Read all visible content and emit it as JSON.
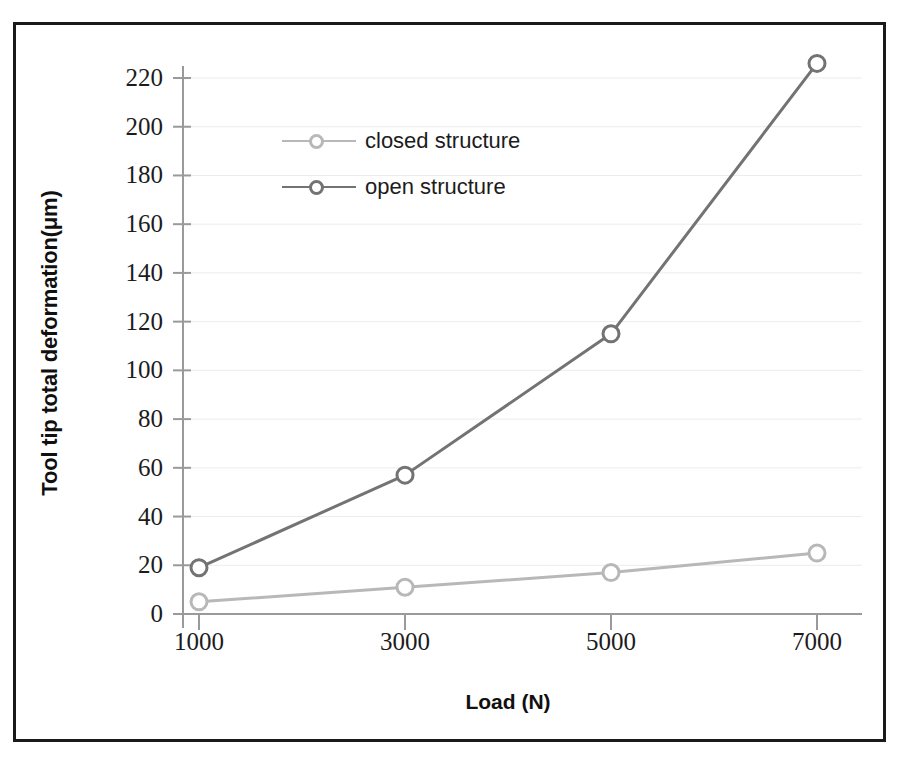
{
  "chart_data": {
    "type": "line",
    "title": "",
    "subtitle": "",
    "xlabel": "Load (N)",
    "ylabel": "Tool tip total deformation(μm)",
    "categories": [
      "1000",
      "3000",
      "5000",
      "7000"
    ],
    "x": [
      1000,
      3000,
      5000,
      7000
    ],
    "series": [
      {
        "name": "closed structure",
        "values": [
          5,
          11,
          17,
          25
        ],
        "color": "#b8b8b8",
        "marker": "open-circle"
      },
      {
        "name": "open structure",
        "values": [
          19,
          57,
          115,
          226
        ],
        "color": "#737373",
        "marker": "open-circle"
      }
    ],
    "ylim": [
      0,
      230
    ],
    "yticks": [
      0,
      20,
      40,
      60,
      80,
      100,
      120,
      140,
      160,
      180,
      200,
      220
    ],
    "ytick_labels": [
      "0",
      "20",
      "40",
      "60",
      "80",
      "100",
      "120",
      "140",
      "160",
      "180",
      "200",
      "220"
    ],
    "xtick_labels": [
      "1000",
      "3000",
      "5000",
      "7000"
    ],
    "grid": "horizontal-faint",
    "legend_position": "upper-left-inside",
    "frame": "outer-black-border",
    "background": "#ffffff"
  },
  "legend": {
    "items": [
      {
        "label": "closed structure"
      },
      {
        "label": "open structure"
      }
    ]
  },
  "axes": {
    "x_title": "Load (N)",
    "y_title": "Tool tip total deformation(μm)"
  },
  "colors": {
    "closed_structure": "#b8b8b8",
    "open_structure": "#737373",
    "axis": "#9a9a9a",
    "frame": "#1a1a1a",
    "grid": "#ececec",
    "text": "#1c1c1c"
  }
}
